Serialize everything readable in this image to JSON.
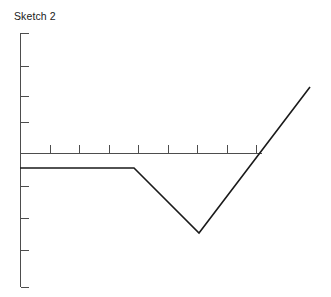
{
  "chart": {
    "title": "Sketch 2"
  },
  "chart_data": {
    "type": "line",
    "title": "Sketch 2",
    "xlabel": "",
    "ylabel": "",
    "grid": false,
    "legend": false,
    "legend_position": "none",
    "axis_style": "hand-sketch, unlabeled ticks, no tick numbers",
    "xlim": [
      0,
      10
    ],
    "ylim": [
      -4,
      5
    ],
    "x_ticks": [
      0,
      1,
      2,
      3,
      4,
      5,
      6,
      7,
      8
    ],
    "x_tick_labels": [
      "",
      "",
      "",
      "",
      "",
      "",
      "",
      "",
      ""
    ],
    "y_ticks": [
      -4,
      -3,
      -2,
      -1,
      0,
      1,
      2,
      3,
      4,
      5
    ],
    "y_tick_labels": [
      "",
      "",
      "",
      "",
      "",
      "",
      "",
      "",
      "",
      ""
    ],
    "series": [
      {
        "name": "sketch-2-curve",
        "color": "#1a1a1a",
        "x": [
          0.0,
          3.8,
          6.0,
          9.7
        ],
        "y": [
          -0.55,
          -0.55,
          -3.05,
          2.4
        ],
        "shape": "flat then V-dip then steep rise"
      }
    ],
    "annotations": []
  },
  "geometry": {
    "y_axis": {
      "x": 20,
      "y_top": 33,
      "y_bottom": 287
    },
    "x_axis": {
      "y": 153,
      "x_left": 20,
      "x_right": 262
    },
    "y_tick_positions": [
      33,
      66,
      96,
      122,
      153,
      186,
      218,
      250,
      287
    ],
    "x_tick_positions": [
      20,
      50,
      79,
      109,
      138,
      168,
      197,
      227,
      256
    ],
    "polyline_points": "20,168 134,168 199,233 310,87"
  }
}
